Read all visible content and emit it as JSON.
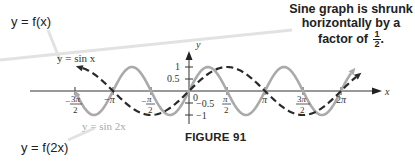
{
  "labels": {
    "original_function": "y = f(x)",
    "transformed_function": "y = f(2x)",
    "note_line1": "Sine graph is shrunk",
    "note_line2": "horizontally by a factor of",
    "note_fraction_num": "1",
    "note_fraction_den": "2",
    "note_period": ".",
    "figure_caption": "FIGURE 91",
    "curve1_label": "y = sin x",
    "curve2_label": "y = sin 2x"
  },
  "colors": {
    "sin_x": "#2a2a2a",
    "sin_2x": "#aaaaaa",
    "axes": "#333333",
    "callout_line": "#dddddd"
  },
  "chart_data": {
    "type": "line",
    "title": "FIGURE 91",
    "xlabel": "x",
    "ylabel": "y",
    "xlim": [
      -5.2,
      6.9
    ],
    "ylim": [
      -1.4,
      1.6
    ],
    "x_ticks": [
      "-3π/2",
      "-π",
      "-π/2",
      "0",
      "π/2",
      "π",
      "3π/2",
      "2π"
    ],
    "y_ticks": [
      "1",
      "0.5",
      "-0.5",
      "-1"
    ],
    "grid": false,
    "series": [
      {
        "name": "y = sin x",
        "style": "dashed",
        "color": "#2a2a2a",
        "function": "sin(x)",
        "domain": [
          -4.4,
          6.9
        ]
      },
      {
        "name": "y = sin 2x",
        "style": "solid",
        "color": "#aaaaaa",
        "function": "sin(2x)",
        "domain": [
          -4.6,
          6.7
        ]
      }
    ],
    "annotations": [
      "Sine graph is shrunk horizontally by a factor of 1/2.",
      "y = f(x)",
      "y = f(2x)"
    ]
  }
}
